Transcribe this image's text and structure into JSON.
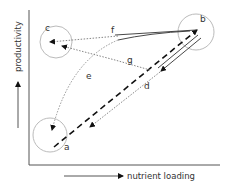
{
  "diagram": {
    "axes": {
      "x_label": "nutrient loading",
      "y_label": "productivity"
    },
    "states": [
      {
        "id": "a",
        "label": "a"
      },
      {
        "id": "b",
        "label": "b"
      },
      {
        "id": "c",
        "label": "c"
      }
    ],
    "paths": [
      {
        "id": "d",
        "label": "d",
        "from": "b",
        "to": "a",
        "style": "dotted"
      },
      {
        "id": "e",
        "label": "e",
        "from": "b",
        "to": "a",
        "style": "dotted-curve"
      },
      {
        "id": "f",
        "label": "f",
        "from": "b",
        "to": "c",
        "style": "dotted"
      },
      {
        "id": "g",
        "label": "g",
        "from": "b",
        "to": "c",
        "style": "dotted"
      }
    ],
    "colors": {
      "line": "#222222",
      "dotted": "#777777",
      "circle": "#bbbbbb"
    }
  }
}
